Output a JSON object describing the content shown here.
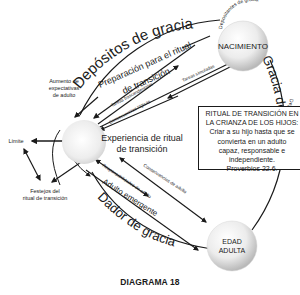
{
  "diagram": {
    "caption": "DIAGRAMA 18",
    "nodes": {
      "birth": "NACIMIENTO",
      "adult_line1": "EDAD",
      "adult_line2": "ADULTA",
      "center_line1": "Experiencia de ritual",
      "center_line2": "de transición"
    },
    "arc_labels": {
      "top": "Depósitos de gracia",
      "right": "Gracia de Dios",
      "bottom": "Dador de gracia"
    },
    "birth_labels": {
      "upper": "Depositantes de gracia",
      "lower": "Depositantes de gracia"
    },
    "arrow_labels": {
      "preparation_line1": "Preparación para el ritual",
      "preparation_line2": "de transición",
      "transcendent_tasks": "Tareas trascendentales",
      "simulated_tasks": "Tareas simuladas",
      "logical_consequences": "Consecuencias lógicas",
      "adult_responsibilities": "Responsabilidades de adulto",
      "adult_consequences": "Consecuencias de adulto",
      "emerging_adult": "Adulto emergente"
    },
    "left_labels": {
      "expectations_line1": "Aumento de",
      "expectations_line2": "expectativas",
      "expectations_line3": "de adulto",
      "limit": "Límite",
      "celebrations_line1": "Festejos del",
      "celebrations_line2": "ritual de transición"
    },
    "box": {
      "line1": "RITUAL DE TRANSICIÓN EN",
      "line2": "LA CRIANZA DE LOS HIJOS:",
      "line3": "Criar a su hijo hasta que se",
      "line4": "convierta en un adulto",
      "line5": "capaz, responsable e",
      "line6": "independiente.",
      "line7": "Proverbios 22.6."
    }
  }
}
